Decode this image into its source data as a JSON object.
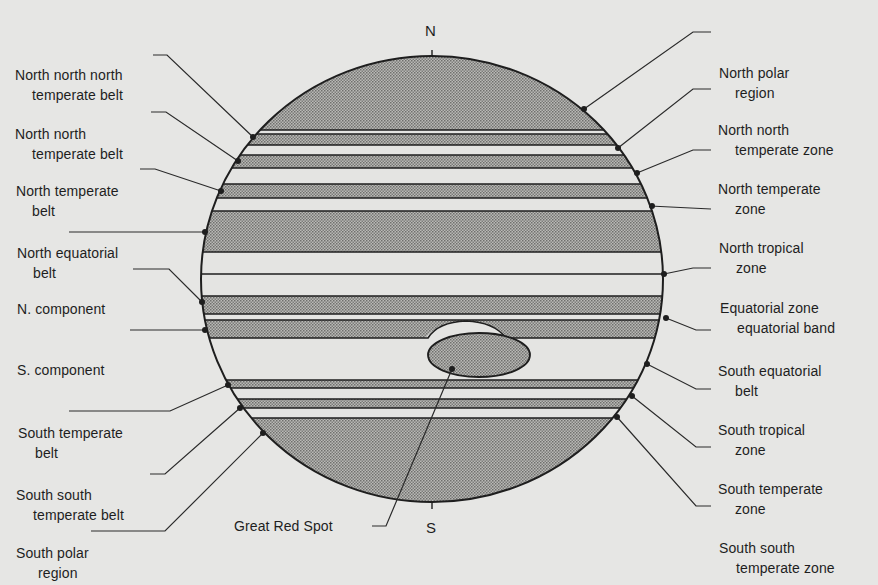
{
  "poles": {
    "north": "N",
    "south": "S"
  },
  "colors": {
    "background": "#e6e6e4",
    "belt_shade": "#9a9a98",
    "zone_light": "#e4e4e2",
    "ink": "#1e1e1e"
  },
  "left_labels": [
    {
      "line1": "North north north",
      "line2": "temperate belt"
    },
    {
      "line1": "North north",
      "line2": "temperate belt"
    },
    {
      "line1": "North temperate",
      "line2": "belt"
    },
    {
      "line1": "North equatorial",
      "line2": "belt"
    },
    {
      "line1": "N. component",
      "line2": ""
    },
    {
      "line1": "S. component",
      "line2": ""
    },
    {
      "line1": "South temperate",
      "line2": "belt"
    },
    {
      "line1": "South south",
      "line2": "temperate belt"
    },
    {
      "line1": "South polar",
      "line2": "region"
    }
  ],
  "right_labels": [
    {
      "line1": "North polar",
      "line2": "region"
    },
    {
      "line1": "North north",
      "line2": "temperate zone"
    },
    {
      "line1": "North temperate",
      "line2": "zone"
    },
    {
      "line1": "North tropical",
      "line2": "zone"
    },
    {
      "line1": "Equatorial zone",
      "line2": "equatorial band"
    },
    {
      "line1": "South equatorial",
      "line2": "belt"
    },
    {
      "line1": "South tropical",
      "line2": "zone"
    },
    {
      "line1": "South temperate",
      "line2": "zone"
    },
    {
      "line1": "South south",
      "line2": "temperate zone"
    }
  ],
  "bottom_label": "Great Red Spot"
}
